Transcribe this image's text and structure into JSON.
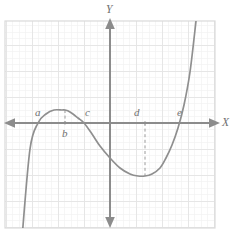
{
  "figure": {
    "kind": "cubic-polynomial-graph",
    "background_color": "#ffffff",
    "frame_color": "#d9d9d9",
    "grid_major_color": "#e3e3e3",
    "grid_minor_color": "#f1f1f1",
    "axis_color": "#8c8c8c",
    "curve_color": "#8f8f8f",
    "dash_color": "#9a9a9a",
    "label_color": "#6f6f6f"
  },
  "axes": {
    "x_label": "X",
    "y_label": "Y",
    "origin_px": {
      "x": 110,
      "y": 123
    },
    "x_axis_y_px": 123,
    "y_axis_x_px": 110,
    "frame_px": {
      "left": 5,
      "top": 21,
      "right": 215,
      "bottom": 228
    },
    "grid_major_step_px": 26,
    "grid_minor_step_px": 6.5,
    "ticks": [],
    "tick_labels": []
  },
  "point_labels": [
    {
      "name": "a",
      "text": "a",
      "x": 35,
      "y": 107
    },
    {
      "name": "b",
      "text": "b",
      "x": 62,
      "y": 128
    },
    {
      "name": "c",
      "text": "c",
      "x": 85,
      "y": 107
    },
    {
      "name": "d",
      "text": "d",
      "x": 134,
      "y": 107
    },
    {
      "name": "e",
      "text": "e",
      "x": 177,
      "y": 107
    }
  ],
  "axis_labels": [
    {
      "name": "y-axis-label",
      "text": "Y",
      "x": 106,
      "y": 4
    },
    {
      "name": "x-axis-label",
      "text": "X",
      "x": 222,
      "y": 117
    }
  ],
  "chart_data": {
    "type": "line",
    "title": "",
    "xlabel": "X",
    "ylabel": "Y",
    "grid": true,
    "legend": null,
    "annotations": [
      "a",
      "b",
      "c",
      "d",
      "e"
    ],
    "features": {
      "x_intercepts_labeled": [
        "a",
        "c",
        "e"
      ],
      "local_maximum_label": "b",
      "local_minimum_label": "d"
    },
    "x_pixels": [
      22,
      30,
      38,
      46,
      54,
      62,
      65,
      70,
      78,
      84,
      92,
      100,
      110,
      120,
      130,
      138,
      145,
      152,
      160,
      166,
      172,
      178,
      184,
      190,
      196
    ],
    "y_pixels": [
      238,
      149,
      123,
      114,
      110,
      110,
      110,
      112,
      118,
      123,
      134,
      146,
      158,
      168,
      174,
      176,
      176,
      174,
      168,
      158,
      145,
      128,
      105,
      72,
      21
    ],
    "curve_path": "M 22,240 C 28,170 33,132 40,120 C 48,107 60,105 68,112 C 78,121 90,140 104,155 C 118,170 132,177 145,176 C 158,175 168,162 177,137 C 186,112 192,62 197,20",
    "dashed_segments": [
      {
        "name": "b-dashed-line",
        "x": 65,
        "y_from": 110,
        "y_to": 123
      },
      {
        "name": "d-dashed-line",
        "x": 145,
        "y_from": 123,
        "y_to": 176
      }
    ],
    "marker_points": [
      {
        "label": "b",
        "x": 65,
        "y": 123
      },
      {
        "label": "d",
        "x": 145,
        "y": 123
      }
    ]
  }
}
